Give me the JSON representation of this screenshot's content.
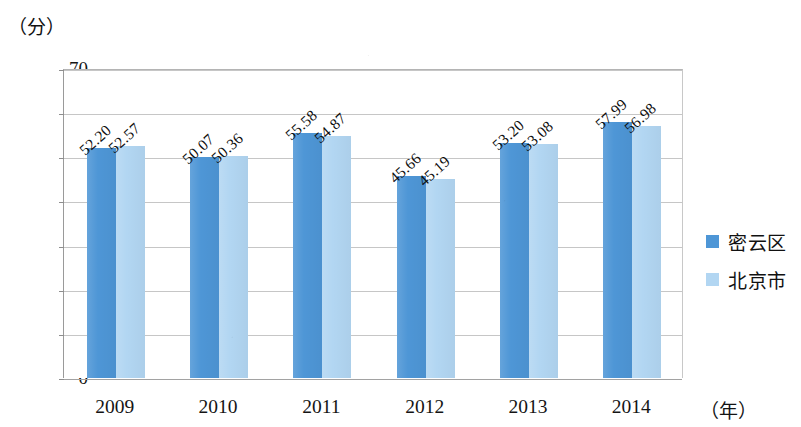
{
  "chart_data": {
    "type": "bar",
    "title": "",
    "subtitle": "",
    "xlabel": "（年）",
    "ylabel": "（分）",
    "categories": [
      "2009",
      "2010",
      "2011",
      "2012",
      "2013",
      "2014"
    ],
    "series": [
      {
        "name": "密云区",
        "color": "#4e96d6",
        "values": [
          52.2,
          50.07,
          55.58,
          45.66,
          53.2,
          57.99
        ],
        "labels": [
          "52.20",
          "50.07",
          "55.58",
          "45.66",
          "53.20",
          "57.99"
        ]
      },
      {
        "name": "北京市",
        "color": "#b2d6f2",
        "values": [
          52.57,
          50.36,
          54.87,
          45.19,
          53.08,
          56.98
        ],
        "labels": [
          "52.57",
          "50.36",
          "54.87",
          "45.19",
          "53.08",
          "56.98"
        ]
      }
    ],
    "ylim": [
      0,
      70
    ],
    "yticks": [
      0,
      10,
      20,
      30,
      40,
      50,
      60,
      70
    ],
    "ytick_labels": [
      "0",
      "10",
      "20",
      "30",
      "40",
      "50",
      "60",
      "70"
    ],
    "grid": "horizontal",
    "legend_position": "right",
    "value_labels_rotation": -42
  }
}
